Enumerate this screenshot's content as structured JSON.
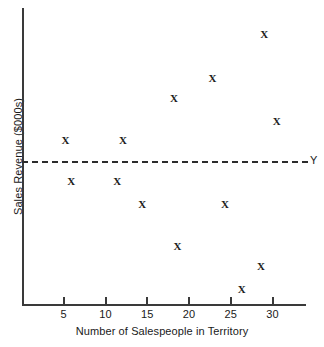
{
  "chart_data": {
    "type": "scatter",
    "title": "",
    "xlabel": "Number of Salespeople in Territory",
    "ylabel": "Sales Revenue ($000s)",
    "xticks": [
      5,
      10,
      15,
      20,
      25,
      30
    ],
    "xtick_labels": [
      "5",
      "10",
      "15",
      "20",
      "25",
      "30"
    ],
    "yticks": [],
    "ytick_labels": [],
    "xlim": [
      0,
      34
    ],
    "ylim": [
      0,
      100
    ],
    "grid": false,
    "legend": null,
    "marker_glyph": "X",
    "points": [
      {
        "x": 5.2,
        "y": 55.0
      },
      {
        "x": 12.1,
        "y": 55.0
      },
      {
        "x": 5.9,
        "y": 41.2
      },
      {
        "x": 11.4,
        "y": 41.2
      },
      {
        "x": 14.4,
        "y": 33.4
      },
      {
        "x": 18.6,
        "y": 19.3
      },
      {
        "x": 24.3,
        "y": 33.4
      },
      {
        "x": 26.3,
        "y": 4.7
      },
      {
        "x": 28.6,
        "y": 12.4
      },
      {
        "x": 18.2,
        "y": 69.1
      },
      {
        "x": 22.8,
        "y": 76.1
      },
      {
        "x": 29.0,
        "y": 90.9
      },
      {
        "x": 30.5,
        "y": 61.4
      }
    ],
    "annotations": [
      {
        "type": "hline",
        "label": "Y",
        "y": 48.2,
        "style": "dashed"
      }
    ]
  },
  "axes": {
    "x_axis_name": "x-axis",
    "y_axis_name": "y-axis"
  }
}
